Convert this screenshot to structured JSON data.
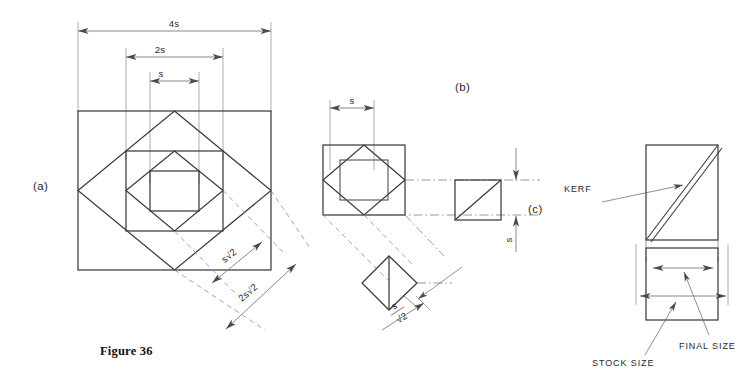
{
  "figure": {
    "caption": "Figure 36",
    "parts": {
      "a": "(a)",
      "b": "(b)",
      "c": "(c)"
    }
  },
  "part_a": {
    "dimensions": [
      {
        "label": "4s",
        "note": "overall outer square width"
      },
      {
        "label": "2s",
        "note": "middle square width"
      },
      {
        "label": "s",
        "note": "inner square width"
      }
    ],
    "diagonal_dimensions": [
      {
        "label": "s√2",
        "note": "inner diamond diagonal"
      },
      {
        "label": "2s√2",
        "note": "outer diamond diagonal"
      }
    ]
  },
  "part_b": {
    "dimensions": [
      {
        "label": "s",
        "note": "inner square width, top"
      },
      {
        "label": "s",
        "note": "detail square height, right"
      }
    ],
    "fraction_dimension": {
      "numerator": "s",
      "denominator": "√2",
      "note": "diamond side"
    }
  },
  "part_c": {
    "annotations": [
      {
        "label": "KERF",
        "note": "saw cut width on diagonal"
      },
      {
        "label": "STOCK SIZE",
        "note": "outer dimension"
      },
      {
        "label": "FINAL SIZE",
        "note": "inner dimension"
      }
    ]
  },
  "colors": {
    "object_line": "#3c3c3c",
    "dimension_line": "#6a6a6a",
    "center_line": "#7a7a7a",
    "hidden_line": "#8d8d8d",
    "background": "#ffffff"
  }
}
